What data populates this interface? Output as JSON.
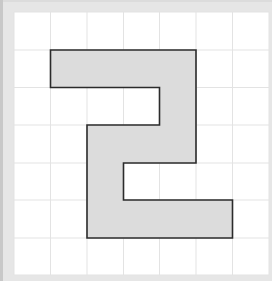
{
  "diagram": {
    "type": "grid-shape",
    "grid": {
      "columns": 7,
      "rows": 7,
      "origin_x": 14,
      "origin_y": 12,
      "x_lines": [
        14,
        50.5,
        87,
        123.5,
        159.5,
        196,
        232.5,
        269
      ],
      "y_lines": [
        12,
        50,
        87.5,
        125,
        163,
        200,
        238,
        275
      ],
      "background": "#ffffff",
      "line_color": "#e3e3e3"
    },
    "shape": {
      "description": "Rectilinear S/2-shaped polygon outlined on grid",
      "vertices_cells": [
        [
          1,
          1
        ],
        [
          5,
          1
        ],
        [
          5,
          4
        ],
        [
          3,
          4
        ],
        [
          3,
          5
        ],
        [
          6,
          5
        ],
        [
          6,
          6
        ],
        [
          2,
          6
        ],
        [
          2,
          3
        ],
        [
          4,
          3
        ],
        [
          4,
          2
        ],
        [
          1,
          2
        ]
      ],
      "fill": "#dcdcdc",
      "stroke": "#2b2b2b",
      "stroke_width": 1.6
    },
    "frame_color": "#e6e6e6"
  }
}
